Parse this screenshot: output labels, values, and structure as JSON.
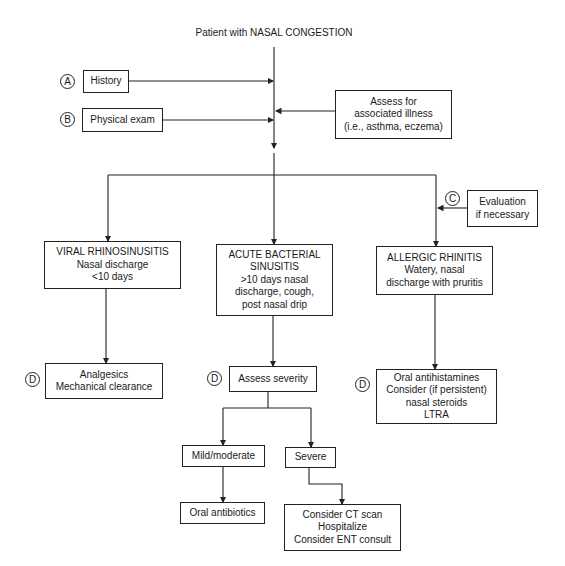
{
  "title": "Patient with NASAL CONGESTION",
  "markers": {
    "A": "A",
    "B": "B",
    "C": "C",
    "D": "D"
  },
  "nodes": {
    "history": [
      "History"
    ],
    "physical_exam": [
      "Physical exam"
    ],
    "assess_illness": [
      "Assess for",
      "associated illness",
      "(i.e., asthma, eczema)"
    ],
    "evaluation": [
      "Evaluation",
      "if necessary"
    ],
    "viral": [
      "VIRAL RHINOSINUSITIS",
      "Nasal discharge",
      "<10 days"
    ],
    "bacterial": [
      "ACUTE BACTERIAL",
      "SINUSITIS",
      ">10 days nasal",
      "discharge, cough,",
      "post nasal drip"
    ],
    "allergic": [
      "ALLERGIC RHINITIS",
      "Watery, nasal",
      "discharge with pruritis"
    ],
    "viral_treatment": [
      "Analgesics",
      "Mechanical clearance"
    ],
    "assess_severity": [
      "Assess severity"
    ],
    "allergic_treatment": [
      "Oral antihistamines",
      "Consider (if persistent)",
      "nasal steroids",
      "LTRA"
    ],
    "mild_moderate": [
      "Mild/moderate"
    ],
    "severe": [
      "Severe"
    ],
    "oral_antibiotics": [
      "Oral antibiotics"
    ],
    "severe_treatment": [
      "Consider CT scan",
      "Hospitalize",
      "Consider ENT consult"
    ]
  },
  "colors": {
    "line": "#222222",
    "background": "#ffffff"
  }
}
